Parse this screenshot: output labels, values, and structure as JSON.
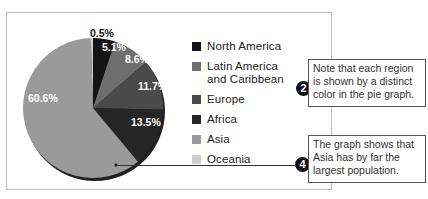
{
  "chart_data": {
    "type": "pie",
    "title": "",
    "categories": [
      "North America",
      "Latin America and Caribbean",
      "Europe",
      "Africa",
      "Asia",
      "Oceania"
    ],
    "values": [
      5.1,
      8.6,
      11.7,
      13.5,
      60.6,
      0.5
    ],
    "labels": [
      "5.1%",
      "8.6%",
      "11.7%",
      "13.5%",
      "60.6%",
      "0.5%"
    ],
    "colors": [
      "#141414",
      "#6e6e6e",
      "#4a4a4a",
      "#262626",
      "#9a9a9a",
      "#cfcfcf"
    ],
    "legend_position": "right"
  },
  "legend": {
    "items": [
      {
        "label": "North America",
        "color": "#141414"
      },
      {
        "label": "Latin America and Caribbean",
        "color": "#6e6e6e"
      },
      {
        "label": "Europe",
        "color": "#4a4a4a"
      },
      {
        "label": "Africa",
        "color": "#262626"
      },
      {
        "label": "Asia",
        "color": "#9a9a9a"
      },
      {
        "label": "Oceania",
        "color": "#cfcfcf"
      }
    ]
  },
  "slice_labels": {
    "oceania": "0.5%",
    "north_america": "5.1%",
    "latin_america": "8.6%",
    "europe": "11.7%",
    "africa": "13.5%",
    "asia": "60.6%"
  },
  "callouts": [
    {
      "number": "2",
      "text": "Note that each region is shown by a distinct color in the pie graph."
    },
    {
      "number": "4",
      "text": "The graph shows that Asia has by far the largest population."
    }
  ]
}
